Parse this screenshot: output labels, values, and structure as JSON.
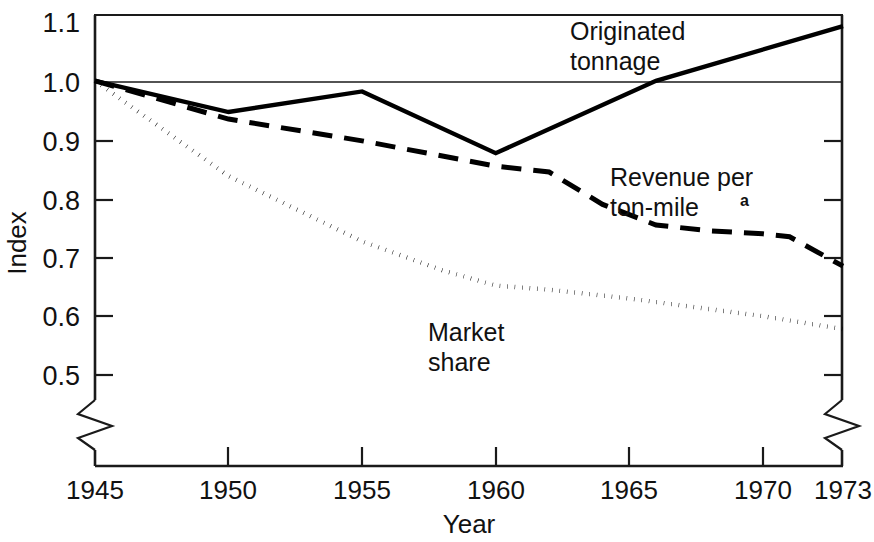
{
  "chart_data": {
    "type": "line",
    "title": "",
    "xlabel": "Year",
    "ylabel": "Index",
    "xlim": [
      1945,
      1973
    ],
    "ylim": [
      0.5,
      1.1
    ],
    "grid": false,
    "axis_break_left": true,
    "axis_break_right": true,
    "reference_line_y": 1.0,
    "legend_position": "inline-annotations",
    "x_ticks": [
      1945,
      1950,
      1955,
      1960,
      1965,
      1970,
      1973
    ],
    "x_tick_labels": [
      "1945",
      "1950",
      "1955",
      "1960",
      "1965",
      "1970",
      "1973"
    ],
    "y_ticks": [
      0.5,
      0.6,
      0.7,
      0.8,
      0.9,
      1.0,
      1.1
    ],
    "y_tick_labels": [
      "0.5",
      "0.6",
      "0.7",
      "0.8",
      "0.9",
      "1.0",
      "1.1"
    ],
    "series": [
      {
        "name": "Originated tonnage",
        "label_lines": [
          "Originated",
          "tonnage"
        ],
        "style": "solid",
        "x": [
          1945,
          1950,
          1955,
          1960,
          1966,
          1973
        ],
        "values": [
          1.0,
          0.947,
          0.982,
          0.877,
          1.0,
          1.093
        ]
      },
      {
        "name": "Revenue per ton-mile",
        "label_lines": [
          "Revenue per",
          "ton-mile"
        ],
        "label_superscript": "a",
        "style": "dashed",
        "x": [
          1945,
          1950,
          1955,
          1960,
          1962,
          1964,
          1966,
          1968,
          1970,
          1971,
          1973
        ],
        "values": [
          1.0,
          0.935,
          0.898,
          0.855,
          0.845,
          0.79,
          0.755,
          0.745,
          0.74,
          0.735,
          0.685
        ]
      },
      {
        "name": "Market share",
        "label_lines": [
          "Market",
          "share"
        ],
        "style": "dotted",
        "x": [
          1945,
          1950,
          1955,
          1958,
          1960,
          1962,
          1965,
          1968,
          1970,
          1973
        ],
        "values": [
          1.0,
          0.838,
          0.727,
          0.678,
          0.652,
          0.645,
          0.63,
          0.612,
          0.6,
          0.578
        ]
      }
    ]
  },
  "annotations": {
    "originated_tonnage": {
      "line1": "Originated",
      "line2": "tonnage"
    },
    "revenue_per_ton_mile": {
      "line1": "Revenue per",
      "line2": "ton-mile",
      "superscript": "a"
    },
    "market_share": {
      "line1": "Market",
      "line2": "share"
    }
  },
  "axes": {
    "y_title": "Index",
    "x_title": "Year",
    "y_labels": [
      "1.1",
      "1.0",
      "0.9",
      "0.8",
      "0.7",
      "0.6",
      "0.5"
    ],
    "x_labels": [
      "1945",
      "1950",
      "1955",
      "1960",
      "1965",
      "1970",
      "1973"
    ]
  },
  "colors": {
    "ink": "#000000",
    "background": "#ffffff",
    "axis": "#1a1a1a"
  }
}
